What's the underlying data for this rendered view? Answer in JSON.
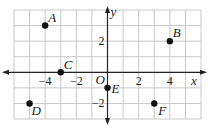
{
  "chart_data": {
    "type": "scatter",
    "title": "",
    "xlabel": "x",
    "ylabel": "y",
    "origin_label": "O",
    "xlim": [
      -6,
      6
    ],
    "ylim": [
      -3,
      4
    ],
    "grid": true,
    "x_ticks": [
      {
        "value": -4,
        "label": "−4"
      },
      {
        "value": -2,
        "label": "−2"
      },
      {
        "value": 2,
        "label": "2"
      },
      {
        "value": 4,
        "label": "4"
      }
    ],
    "y_ticks": [
      {
        "value": 2,
        "label": "2"
      },
      {
        "value": -2,
        "label": "−2"
      }
    ],
    "points": [
      {
        "label": "A",
        "x": -4,
        "y": 3
      },
      {
        "label": "B",
        "x": 4,
        "y": 2
      },
      {
        "label": "C",
        "x": -3,
        "y": 0
      },
      {
        "label": "D",
        "x": -5,
        "y": -2
      },
      {
        "label": "E",
        "x": 0,
        "y": -1
      },
      {
        "label": "F",
        "x": 3,
        "y": -2
      }
    ],
    "colors": {
      "grid": "#c8c8c8",
      "axis": "#222222",
      "point": "#111111"
    }
  }
}
